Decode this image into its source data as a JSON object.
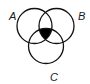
{
  "diagram": {
    "type": "venn",
    "sets": [
      {
        "id": "A",
        "label": "A",
        "cx": 34.5,
        "cy": 26,
        "r": 17.5,
        "label_x": 9,
        "label_y": 20
      },
      {
        "id": "B",
        "label": "B",
        "cx": 56.5,
        "cy": 26,
        "r": 17.5,
        "label_x": 78,
        "label_y": 20
      },
      {
        "id": "C",
        "label": "C",
        "cx": 46,
        "cy": 46,
        "r": 17.5,
        "label_x": 50,
        "label_y": 81
      }
    ],
    "shaded_region": "A ∩ B ∩ C",
    "colors": {
      "stroke": "#111111",
      "fill": "#000000",
      "background": "#ffffff"
    }
  }
}
